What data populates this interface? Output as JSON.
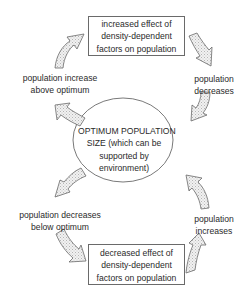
{
  "diagram": {
    "center": {
      "lines": [
        "OPTIMUM POPULATION",
        "SIZE (which can be",
        "supported by",
        "environment)"
      ]
    },
    "top_box": {
      "lines": [
        "increased effect of",
        "density-dependent",
        "factors on population"
      ]
    },
    "bottom_box": {
      "lines": [
        "decreased effect of",
        "density-dependent",
        "factors on population"
      ]
    },
    "labels": {
      "top_left": [
        "population increase",
        "above optimum"
      ],
      "top_right": [
        "population",
        "decreases"
      ],
      "bottom_left": [
        "population decreases",
        "below optimum"
      ],
      "bottom_right": [
        "population",
        "increases"
      ]
    },
    "arrows": [
      {
        "name": "arrow-tl-to-top-box",
        "direction": "up-right"
      },
      {
        "name": "arrow-top-box-to-tr",
        "direction": "down-right"
      },
      {
        "name": "arrow-tr-to-center",
        "direction": "down-left"
      },
      {
        "name": "arrow-center-to-tl",
        "direction": "up-left"
      },
      {
        "name": "arrow-center-to-bl",
        "direction": "down-left"
      },
      {
        "name": "arrow-bl-to-bottom-box",
        "direction": "down-right"
      },
      {
        "name": "arrow-bottom-box-to-br",
        "direction": "up-right"
      },
      {
        "name": "arrow-br-to-center",
        "direction": "up-left"
      }
    ],
    "colors": {
      "stroke": "#6a6a6a",
      "arrow_fill": "#e6e6e6",
      "text": "#2a2a2a"
    }
  }
}
